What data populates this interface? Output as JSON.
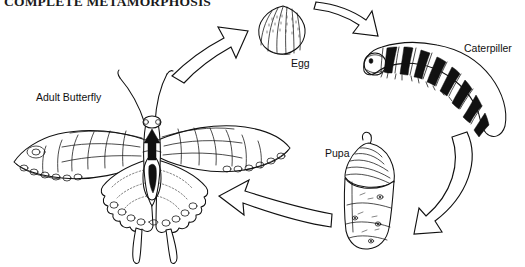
{
  "figure": {
    "title": "COMPLETE METAMORPHOSIS",
    "title_clipped": true,
    "background_color": "#ffffff",
    "ink_color": "#111111",
    "style": "black-and-white line drawing",
    "cycle_direction": "clockwise"
  },
  "stages": [
    {
      "id": "egg",
      "label": "Egg",
      "order": 1,
      "icon": "butterfly-egg-icon",
      "description": "ridged oval egg with stippled surface"
    },
    {
      "id": "caterpillar",
      "label": "Caterpiller",
      "order": 2,
      "icon": "caterpillar-icon",
      "description": "banded larva with black saddle markings and white spots"
    },
    {
      "id": "pupa",
      "label": "Pupa",
      "order": 3,
      "icon": "chrysalis-icon",
      "description": "chrysalis with ridged cremaster top and smooth abdomen"
    },
    {
      "id": "adult-butterfly",
      "label": "Adult Butterfly",
      "order": 4,
      "icon": "swallowtail-butterfly-icon",
      "description": "swallowtail butterfly with open wings, tails and antennae"
    }
  ],
  "arrows": [
    {
      "id": "arrow-butterfly-to-egg",
      "from": "adult-butterfly",
      "to": "egg",
      "direction": "up-right",
      "icon": "block-arrow-icon"
    },
    {
      "id": "arrow-egg-to-caterpillar",
      "from": "egg",
      "to": "caterpillar",
      "direction": "right",
      "icon": "block-arrow-icon"
    },
    {
      "id": "arrow-caterpillar-to-pupa",
      "from": "caterpillar",
      "to": "pupa",
      "direction": "down-left",
      "icon": "curved-block-arrow-icon"
    },
    {
      "id": "arrow-pupa-to-butterfly",
      "from": "pupa",
      "to": "adult-butterfly",
      "direction": "left",
      "icon": "curved-block-arrow-icon"
    }
  ]
}
